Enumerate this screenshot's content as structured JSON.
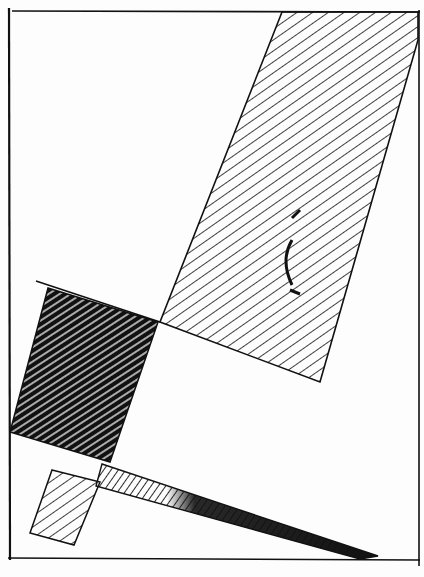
{
  "artwork": {
    "title": "Suprematist hatched composition",
    "medium": "pen-and-ink drawing",
    "colors": {
      "ink": "#111111",
      "paper": "#fdfdfd"
    },
    "shapes": [
      {
        "id": "large-parallelogram",
        "fill": "light-hatching"
      },
      {
        "id": "dark-square",
        "fill": "dense-hatching"
      },
      {
        "id": "long-diagonal-bar",
        "fill": "gradient-hatching"
      },
      {
        "id": "small-square",
        "fill": "light-hatching"
      }
    ]
  }
}
